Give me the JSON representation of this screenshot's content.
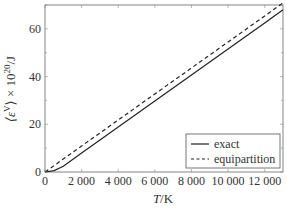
{
  "chart_data": {
    "type": "line",
    "title": "",
    "xlabel": "T/K",
    "ylabel": "⟨ε^V⟩ × 10^20/J",
    "xlim": [
      0,
      13000
    ],
    "ylim": [
      0,
      70
    ],
    "xticks": [
      0,
      2000,
      4000,
      6000,
      8000,
      10000,
      12000
    ],
    "xtick_labels": [
      "0",
      "2 000",
      "4 000",
      "6 000",
      "8 000",
      "10 000",
      "12 000"
    ],
    "yticks": [
      0,
      20,
      40,
      60
    ],
    "ytick_labels": [
      "0",
      "20",
      "40",
      "60"
    ],
    "grid": false,
    "legend_position": "lower right",
    "series": [
      {
        "name": "exact",
        "style": "solid",
        "x": [
          0,
          500,
          1000,
          2000,
          4000,
          6000,
          8000,
          10000,
          12000,
          13000
        ],
        "y": [
          0,
          0.6,
          2.4,
          8.0,
          18.9,
          29.8,
          40.7,
          51.6,
          62.5,
          68.0
        ]
      },
      {
        "name": "equipartition",
        "style": "dashed",
        "x": [
          0,
          2000,
          4000,
          6000,
          8000,
          10000,
          12000,
          13000
        ],
        "y": [
          0,
          10.9,
          21.8,
          32.7,
          43.6,
          54.5,
          65.4,
          70.9
        ]
      }
    ]
  },
  "legend": {
    "exact": "exact",
    "equipartition": "equipartition"
  },
  "axes": {
    "xlabel_T": "T",
    "xlabel_unit": "/K",
    "ylabel_main": "⟨ε",
    "ylabel_sup": "V",
    "ylabel_rest": "⟩ × 10",
    "ylabel_exp": "20",
    "ylabel_unit": "/J"
  }
}
